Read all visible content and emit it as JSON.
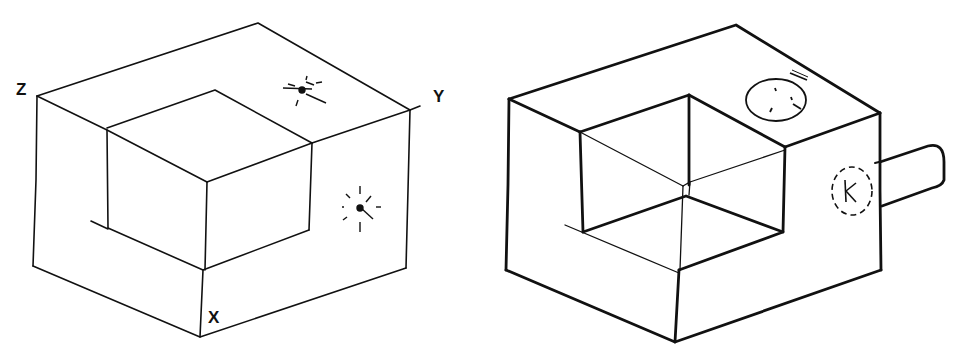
{
  "figures": [
    {
      "id": "left",
      "description": "Isometric sketch of block with stepped corner cut-out, axis-labelled corners",
      "labels": {
        "z": "Z",
        "y": "Y",
        "x": "X"
      },
      "marks": [
        "sun-mark-top-face",
        "sun-mark-right-face"
      ],
      "line_color": "#111111"
    },
    {
      "id": "right",
      "description": "Isometric sketch of same block, bold outline, with circle on top face, dashed circle with K on right face, and cylindrical peg protruding from right side",
      "labels": {
        "k": "K"
      },
      "marks": [
        "circle-top-face",
        "dashed-circle-right-face",
        "peg-right-side"
      ],
      "line_color": "#111111"
    }
  ]
}
